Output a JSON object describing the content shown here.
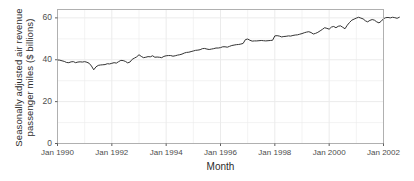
{
  "chart_data": {
    "type": "line",
    "title": "",
    "xlabel": "Month",
    "ylabel": "Seasonally adjusted air revenue passenger miles ($ billions)",
    "ylabel_line1": "Seasonally adjusted air revenue",
    "ylabel_line2": "passenger miles ($ billions)",
    "grid": true,
    "legend_position": "none",
    "line_color": "#333333",
    "panel_background": "#ffffff",
    "panel_border_color": "#b0b0b0",
    "gridline_color": "#ebebeb",
    "ylim": [
      0,
      64
    ],
    "yticks": [
      0,
      20,
      40,
      60
    ],
    "ytick_labels": [
      "0",
      "20",
      "40",
      "60"
    ],
    "xticks": [
      "Jan 1990",
      "Jan 1992",
      "Jan 1994",
      "Jan 1996",
      "Jan 1998",
      "Jan 2000",
      "Jan 2002"
    ],
    "xlim": [
      "Jan 1990",
      "Jan 2002"
    ],
    "x_start_year": 1990,
    "x_end_year": 2002,
    "series": [
      {
        "name": "Air revenue passenger miles",
        "x_start": "1990-01",
        "x_step_months": 1,
        "values": [
          39.9,
          39.8,
          39.5,
          39.2,
          38.7,
          38.6,
          39.0,
          39.1,
          38.6,
          38.9,
          39.0,
          38.9,
          39.1,
          38.8,
          38.3,
          37.0,
          35.2,
          36.6,
          37.3,
          37.5,
          37.6,
          37.7,
          38.1,
          38.0,
          38.3,
          38.6,
          38.4,
          39.1,
          39.7,
          39.6,
          39.2,
          38.5,
          38.9,
          40.2,
          40.8,
          41.4,
          42.4,
          41.6,
          41.0,
          41.2,
          41.5,
          41.4,
          41.9,
          41.2,
          41.3,
          41.2,
          41.0,
          41.6,
          41.9,
          42.0,
          42.0,
          41.7,
          41.9,
          42.2,
          42.4,
          42.7,
          43.2,
          43.5,
          43.6,
          43.9,
          44.2,
          44.5,
          44.6,
          44.8,
          45.3,
          45.4,
          45.1,
          44.9,
          45.1,
          45.3,
          45.6,
          45.6,
          45.8,
          46.2,
          46.2,
          46.0,
          46.4,
          46.8,
          47.0,
          47.2,
          47.3,
          47.5,
          47.8,
          49.6,
          49.9,
          49.3,
          48.9,
          49.0,
          49.0,
          49.1,
          49.2,
          49.1,
          49.0,
          49.1,
          49.2,
          49.3,
          51.4,
          51.5,
          51.3,
          50.9,
          51.1,
          51.2,
          51.4,
          51.3,
          51.6,
          51.8,
          51.9,
          52.2,
          52.5,
          52.9,
          53.2,
          53.4,
          53.0,
          52.3,
          52.6,
          53.1,
          53.8,
          54.5,
          55.3,
          55.0,
          54.6,
          55.6,
          55.9,
          55.3,
          56.0,
          56.2,
          55.5,
          54.8,
          56.5,
          57.8,
          58.9,
          59.4,
          59.9,
          60.3,
          59.9,
          59.5,
          58.6,
          58.1,
          58.8,
          59.2,
          58.9,
          58.1,
          57.6,
          58.4,
          59.6,
          60.1,
          60.2,
          60.0,
          60.3,
          60.1,
          59.8,
          60.3
        ]
      }
    ]
  }
}
